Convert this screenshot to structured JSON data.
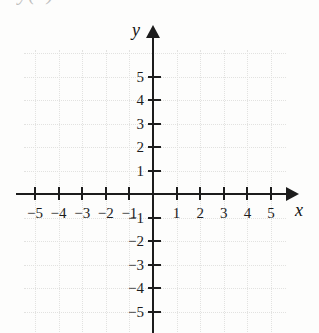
{
  "page": {
    "background_color": "#fdfdfc",
    "ink_color": "#1c1c1c",
    "grid_color": "#c9c9c6"
  },
  "top_equation": {
    "visible_fragment": "y(x) = = ",
    "note_label": "cut-off-equation"
  },
  "chart_data": {
    "type": "scatter",
    "title": "",
    "subtitle": "",
    "xlabel": "x",
    "ylabel": "y",
    "xlim": [
      -6,
      6
    ],
    "ylim": [
      -6,
      6
    ],
    "grid": true,
    "grid_step": 1,
    "legend": "none",
    "series": [
      {
        "name": "plotted-data",
        "x": [],
        "y": []
      }
    ],
    "annotations": [],
    "x_ticks": [
      -5,
      -4,
      -3,
      -2,
      -1,
      1,
      2,
      3,
      4,
      5
    ],
    "x_tick_labels": [
      "−5",
      "−4",
      "−3",
      "−2",
      "−1",
      "1",
      "2",
      "3",
      "4",
      "5"
    ],
    "y_ticks": [
      5,
      4,
      3,
      2,
      1,
      -1,
      -2,
      -3,
      -4,
      -5
    ],
    "y_tick_labels": [
      "5",
      "4",
      "3",
      "2",
      "1",
      "−1",
      "−2",
      "−3",
      "−4",
      "−5"
    ],
    "origin_label": "",
    "axis_arrows": {
      "x_positive": true,
      "y_positive": true
    }
  },
  "axis_labels": {
    "x": "x",
    "y": "y"
  }
}
